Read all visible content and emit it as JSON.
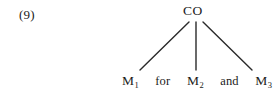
{
  "figure": {
    "example_number": "(9)",
    "background_color": "#ffffff",
    "ink_color": "#1b1b1b",
    "line_color": "#2a2a2a"
  },
  "tree": {
    "root": {
      "label": "CO"
    },
    "leaves": [
      {
        "base": "M",
        "subscript": "1",
        "full": "M1"
      },
      {
        "base": "M",
        "subscript": "2",
        "full": "M2"
      },
      {
        "base": "M",
        "subscript": "3",
        "full": "M3"
      }
    ],
    "conjunctions": [
      {
        "label": "for"
      },
      {
        "label": "and"
      }
    ],
    "branches": [
      {
        "name": "left-branch",
        "x1": 189,
        "y1": 22,
        "x2": 140,
        "y2": 70
      },
      {
        "name": "center-branch",
        "x1": 196,
        "y1": 22,
        "x2": 196,
        "y2": 70
      },
      {
        "name": "right-branch",
        "x1": 203,
        "y1": 22,
        "x2": 252,
        "y2": 70
      }
    ]
  }
}
